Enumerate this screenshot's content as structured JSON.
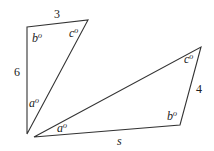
{
  "diagram": {
    "type": "geometry-triangles",
    "stroke_color": "#333333",
    "background": "#ffffff",
    "triangle_1": {
      "vertices": {
        "top_left": [
          27,
          27
        ],
        "top_right": [
          88,
          20
        ],
        "bottom": [
          27,
          134
        ]
      },
      "side_labels": {
        "top": "3",
        "left": "6"
      },
      "angle_labels": {
        "top_left": "b",
        "top_right": "c",
        "bottom": "a"
      },
      "degree_symbol": "o"
    },
    "triangle_2": {
      "vertices": {
        "left": [
          34,
          137
        ],
        "top_right": [
          201,
          47
        ],
        "bottom_right": [
          180,
          125
        ]
      },
      "side_labels": {
        "right": "4",
        "bottom": "s"
      },
      "angle_labels": {
        "left": "a",
        "top_right": "c",
        "bottom_right": "b"
      },
      "degree_symbol": "o"
    }
  }
}
